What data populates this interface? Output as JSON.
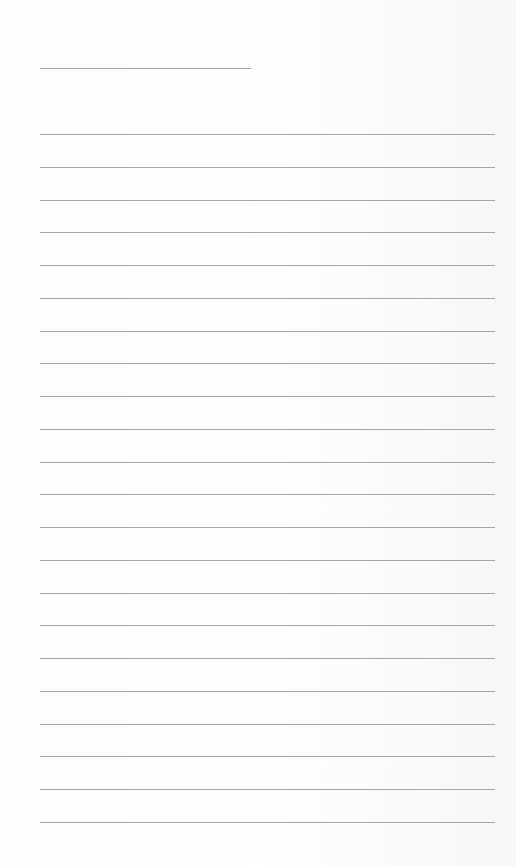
{
  "document": {
    "type": "lined-notepaper",
    "title_line": {
      "label": "Title line",
      "x": 40,
      "y": 68,
      "width": 211
    },
    "writing_lines": {
      "label": "Writing lines",
      "count": 22,
      "x": 40,
      "first_y": 134,
      "last_y": 822,
      "width": 455
    },
    "colors": {
      "paper": "#fcfcfc",
      "rule": "#a6a6a6"
    }
  }
}
